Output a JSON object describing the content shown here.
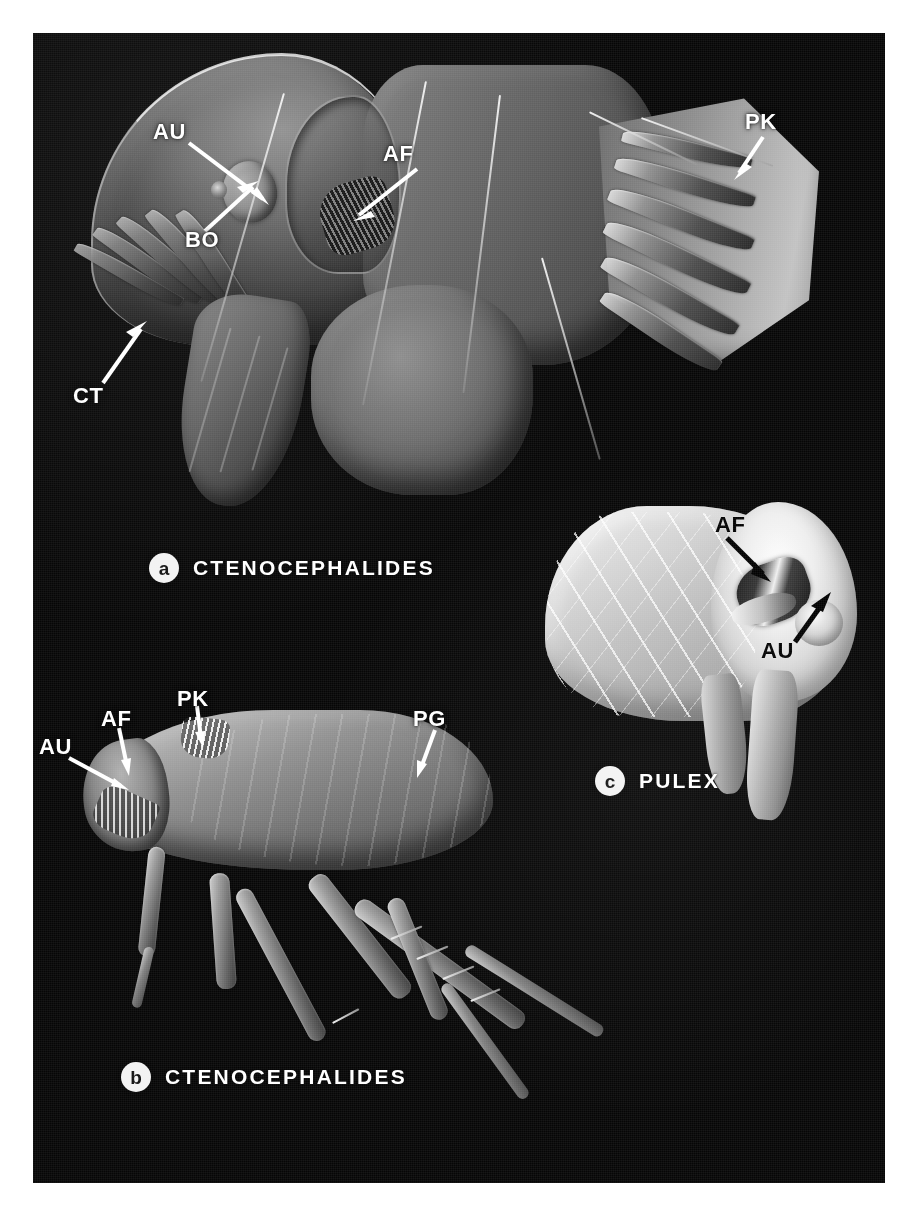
{
  "figure": {
    "kind": "scanning-electron-micrograph-plate",
    "background_color": "#ffffff",
    "plate_color": "#060606",
    "label_color_light": "#ffffff",
    "label_color_dark": "#000000",
    "badge_color": "#f2f2f2"
  },
  "panels": [
    {
      "id": "a",
      "badge": "a",
      "taxon": "CTENOCEPHALIDES",
      "description": "Lateral view of head and prothorax showing genal and pronotal combs",
      "labels": [
        {
          "key": "AU",
          "text": "AU",
          "tone": "white",
          "meaning": "eye"
        },
        {
          "key": "AF",
          "text": "AF",
          "tone": "white",
          "meaning": "antennal fossa"
        },
        {
          "key": "BO",
          "text": "BO",
          "tone": "white",
          "meaning": "sensory pit"
        },
        {
          "key": "PK",
          "text": "PK",
          "tone": "white",
          "meaning": "pronotal comb"
        },
        {
          "key": "CT",
          "text": "CT",
          "tone": "white",
          "meaning": "genal comb"
        }
      ]
    },
    {
      "id": "b",
      "badge": "b",
      "taxon": "CTENOCEPHALIDES",
      "description": "Whole adult flea in lateral view",
      "labels": [
        {
          "key": "AU",
          "text": "AU",
          "tone": "white",
          "meaning": "eye"
        },
        {
          "key": "AF",
          "text": "AF",
          "tone": "white",
          "meaning": "antennal fossa"
        },
        {
          "key": "PK",
          "text": "PK",
          "tone": "white",
          "meaning": "pronotal comb"
        },
        {
          "key": "PG",
          "text": "PG",
          "tone": "white",
          "meaning": "pygidium"
        }
      ]
    },
    {
      "id": "c",
      "badge": "c",
      "taxon": "PULEX",
      "description": "Lateral view of head lacking combs",
      "labels": [
        {
          "key": "AF",
          "text": "AF",
          "tone": "black",
          "meaning": "antennal fossa"
        },
        {
          "key": "AU",
          "text": "AU",
          "tone": "black",
          "meaning": "eye"
        }
      ]
    }
  ],
  "footnote": {
    "text": ""
  }
}
